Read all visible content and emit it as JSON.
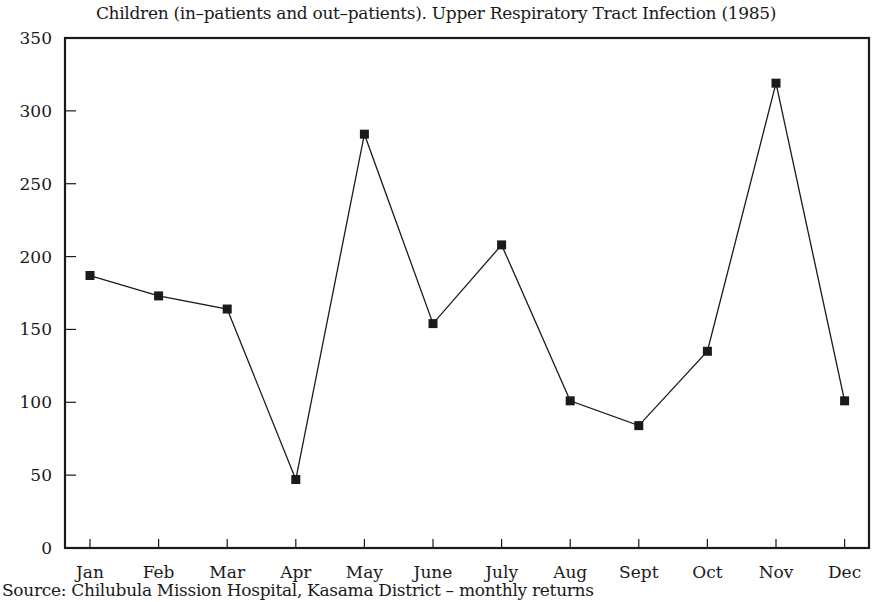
{
  "chart_data": {
    "type": "line",
    "title": "Children (in–patients and out–patients).  Upper Respiratory Tract Infection (1985)",
    "source": "Source:  Chilubula Mission Hospital, Kasama District – monthly returns",
    "xlabel": "",
    "ylabel": "",
    "categories": [
      "Jan",
      "Feb",
      "Mar",
      "Apr",
      "May",
      "June",
      "July",
      "Aug",
      "Sept",
      "Oct",
      "Nov",
      "Dec"
    ],
    "series": [
      {
        "name": "Upper Respiratory Tract Infection",
        "values": [
          187,
          173,
          164,
          47,
          284,
          154,
          208,
          101,
          84,
          135,
          319,
          101
        ],
        "marker": "square",
        "color": "#1a1a1a"
      }
    ],
    "ylim": [
      0,
      350
    ],
    "yticks": [
      0,
      50,
      100,
      150,
      200,
      250,
      300,
      350
    ],
    "grid": false,
    "legend": "none"
  }
}
